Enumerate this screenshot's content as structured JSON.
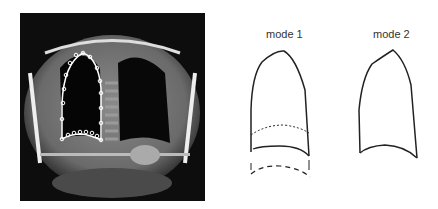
{
  "figure": {
    "left_panel": {
      "description": "Coronal MRI of thorax with lung contour and control points",
      "contour_color": "#ffffff"
    },
    "right_panel": {
      "modes": [
        {
          "label": "mode 1"
        },
        {
          "label": "mode 2"
        }
      ]
    }
  }
}
